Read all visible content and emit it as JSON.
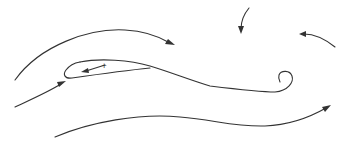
{
  "diagram": {
    "title": "",
    "background": "#ffffff",
    "stroke_color": "#333333",
    "elements": [
      {
        "id": "top-arc-streamline",
        "kind": "arrow-curve",
        "direction": "left-to-right"
      },
      {
        "id": "top-center-arrow",
        "kind": "arrow-curve",
        "direction": "downward"
      },
      {
        "id": "top-right-arrow",
        "kind": "arrow-curve",
        "direction": "right-to-left"
      },
      {
        "id": "airfoil-loop",
        "kind": "closed-curve-with-curl"
      },
      {
        "id": "inner-arrow",
        "kind": "short-arrow",
        "direction": "right-to-left",
        "origin_marker": "+"
      },
      {
        "id": "lower-left-arrow",
        "kind": "arrow-curve",
        "direction": "toward-leading-edge"
      },
      {
        "id": "bottom-streamline",
        "kind": "arrow-curve",
        "direction": "left-to-right"
      }
    ],
    "labels": {
      "origin_marker": "+"
    }
  }
}
